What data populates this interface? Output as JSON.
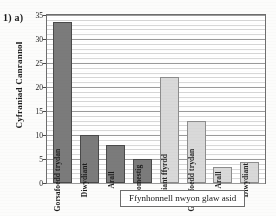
{
  "question_label": "1) a)",
  "chart_data": {
    "type": "bar",
    "title": "",
    "xlabel": "Ffynhonnell nwyon glaw asid",
    "ylabel": "Cyfraniad Canrannol",
    "ylim": [
      0,
      35
    ],
    "y_ticks": [
      0,
      5,
      10,
      15,
      20,
      25,
      30,
      35
    ],
    "grid": true,
    "legend": "none",
    "categories": [
      "Gorsafoedd trydan",
      "Diwydiant",
      "Arall",
      "Domestig",
      "Cludiant ffyrdd",
      "Gorsafoedd trydan",
      "Arall",
      "Diwydiant"
    ],
    "values": [
      33.5,
      10,
      8,
      5,
      22,
      13,
      3.3,
      4.3
    ],
    "colors": [
      "#7b7b7b",
      "#7b7b7b",
      "#7b7b7b",
      "#7b7b7b",
      "#d9d9d9",
      "#d9d9d9",
      "#d9d9d9",
      "#d9d9d9"
    ],
    "series": [
      {
        "name": "set-dark",
        "points": [
          {
            "category": "Gorsafoedd trydan",
            "value": 33.5
          },
          {
            "category": "Diwydiant",
            "value": 10
          },
          {
            "category": "Arall",
            "value": 8
          },
          {
            "category": "Domestig",
            "value": 5
          }
        ]
      },
      {
        "name": "set-light",
        "points": [
          {
            "category": "Cludiant ffyrdd",
            "value": 22
          },
          {
            "category": "Gorsafoedd trydan",
            "value": 13
          },
          {
            "category": "Arall",
            "value": 3.3
          },
          {
            "category": "Diwydiant",
            "value": 4.3
          }
        ]
      }
    ]
  }
}
